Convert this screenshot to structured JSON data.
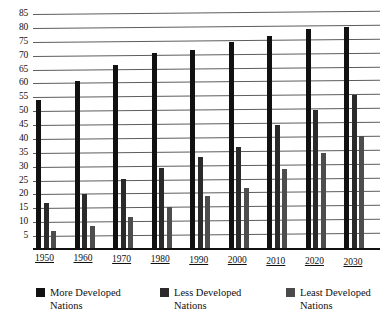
{
  "chart_data": {
    "type": "bar",
    "title": "",
    "xlabel": "",
    "ylabel": "",
    "ylim": [
      0,
      85
    ],
    "yticks": [
      85,
      80,
      75,
      70,
      65,
      60,
      55,
      50,
      45,
      40,
      35,
      30,
      25,
      20,
      15,
      10,
      5
    ],
    "grid": true,
    "legend_position": "bottom",
    "categories": [
      "1950",
      "1960",
      "1970",
      "1980",
      "1990",
      "2000",
      "2010",
      "2020",
      "2030"
    ],
    "series": [
      {
        "name": "More Developed Nations",
        "color": "#111111",
        "values": [
          54,
          61,
          66.5,
          71,
          72,
          75,
          77,
          79.5,
          80.5
        ]
      },
      {
        "name": "Less Developed Nations",
        "color": "#2b2b2b",
        "values": [
          17,
          20,
          25.5,
          29.5,
          33.5,
          37,
          45,
          50.5,
          56
        ]
      },
      {
        "name": "Least Developed Nations",
        "color": "#4a4a4a",
        "values": [
          7,
          8.5,
          12,
          15.5,
          19.5,
          22.5,
          29,
          35,
          41
        ]
      }
    ]
  },
  "legend": {
    "items": [
      {
        "label_line1": "More Developed",
        "label_line2": "Nations",
        "swatch": "more"
      },
      {
        "label_line1": "Less Developed",
        "label_line2": "Nations",
        "swatch": "less"
      },
      {
        "label_line1": "Least Developed",
        "label_line2": "Nations",
        "swatch": "least"
      }
    ]
  }
}
